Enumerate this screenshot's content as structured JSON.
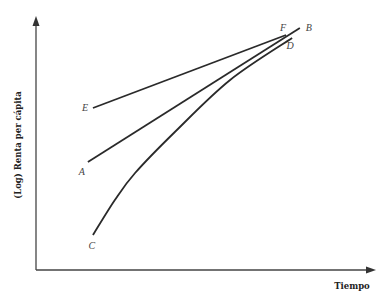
{
  "chart_data": {
    "type": "line",
    "title": "",
    "xlabel": "Tiempo",
    "ylabel": "(Log) Renta per cápita",
    "xlim": [
      0,
      100
    ],
    "ylim": [
      0,
      100
    ],
    "grid": false,
    "ticks": false,
    "series": [
      {
        "name": "E-F",
        "start_label": "E",
        "end_label": "F",
        "x": [
          16.9,
          74.2
        ],
        "y": [
          64.8,
          94.0
        ],
        "smooth": false
      },
      {
        "name": "A-B",
        "start_label": "A",
        "end_label": "B",
        "x": [
          15.4,
          78.3
        ],
        "y": [
          43.2,
          96.8
        ],
        "smooth": false
      },
      {
        "name": "C-D",
        "start_label": "C",
        "end_label": "D",
        "x": [
          16.9,
          23.4,
          29.4,
          41.2,
          57.6,
          76.0
        ],
        "y": [
          14.0,
          28.0,
          38.8,
          55.2,
          76.0,
          92.8
        ],
        "smooth": true
      }
    ]
  }
}
